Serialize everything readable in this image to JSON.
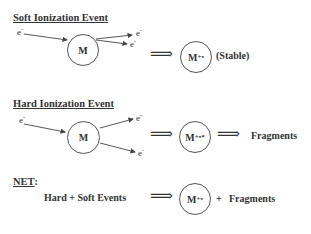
{
  "soft": {
    "heading": "Soft Ionization Event",
    "electron_in": "e",
    "electron_in_charge": "-",
    "molecule": "M",
    "electron_out_1": "e",
    "electron_out_2": "e",
    "charge": "-",
    "product": "M",
    "product_charge": "+•",
    "product_note": "(Stable)"
  },
  "hard": {
    "heading": "Hard Ionization Event",
    "electron_in": "e",
    "electron_in_charge": "-",
    "molecule": "M",
    "electron_out_1": "e",
    "electron_out_2": "e",
    "charge": "-",
    "product": "M",
    "product_charge": "+•*",
    "result": "Fragments"
  },
  "net": {
    "heading": "NET",
    "colon": ":",
    "lhs": "Hard + Soft Events",
    "product": "M",
    "product_charge": "+•",
    "plus": "+",
    "result": "Fragments"
  },
  "symbols": {
    "implies_arrow": "⟹"
  }
}
